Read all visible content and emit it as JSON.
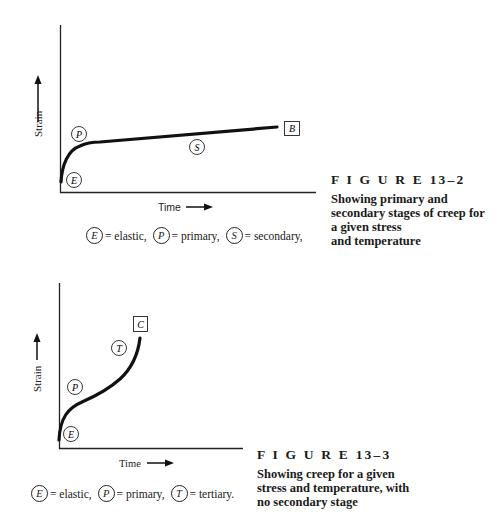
{
  "figures": [
    {
      "id": "figure-13-2",
      "caption_title": "F I G U R E  13–2",
      "caption_lines": [
        "Showing primary and",
        "secondary stages of creep for",
        "a given stress",
        "and temperature"
      ],
      "x_label": "Time",
      "y_label": "Strain",
      "markers": {
        "E": "E",
        "P": "P",
        "S": "S",
        "end": "B"
      },
      "legend": [
        {
          "symbol": "E",
          "text": "= elastic,"
        },
        {
          "symbol": "P",
          "text": "= primary,"
        },
        {
          "symbol": "S",
          "text": "= secondary,"
        }
      ]
    },
    {
      "id": "figure-13-3",
      "caption_title": "F I G U R E  13–3",
      "caption_lines": [
        "Showing creep for a given",
        "stress and temperature, with",
        "no secondary stage"
      ],
      "x_label": "Time",
      "y_label": "Strain",
      "markers": {
        "E": "E",
        "P": "P",
        "T": "T",
        "end": "C"
      },
      "legend": [
        {
          "symbol": "E",
          "text": "= elastic,"
        },
        {
          "symbol": "P",
          "text": "= primary,"
        },
        {
          "symbol": "T",
          "text": "= tertiary."
        }
      ]
    }
  ]
}
